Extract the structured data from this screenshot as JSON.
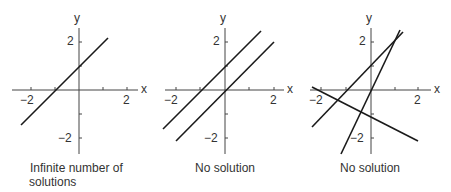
{
  "panels": [
    {
      "caption_line1": "Infinite number of",
      "caption_line2": "solutions",
      "axis_labels": {
        "x": "x",
        "y": "y"
      },
      "ticks": {
        "x_neg": "−2",
        "x_pos": "2",
        "y_pos": "2",
        "y_neg": "−2"
      },
      "lines": [
        "y = x + 1 (coincident)"
      ]
    },
    {
      "caption_line1": "No solution",
      "axis_labels": {
        "x": "x",
        "y": "y"
      },
      "ticks": {
        "x_neg": "−2",
        "x_pos": "2",
        "y_pos": "2",
        "y_neg": "−2"
      },
      "lines": [
        "y = x + 1",
        "y = x"
      ]
    },
    {
      "caption_line1": "No solution",
      "axis_labels": {
        "x": "x",
        "y": "y"
      },
      "ticks": {
        "x_neg": "−2",
        "x_pos": "2",
        "y_pos": "2",
        "y_neg": "−2"
      },
      "lines": [
        "y = x + 1",
        "y = 2x",
        "y = -0.5x - 1"
      ]
    }
  ],
  "colors": {
    "line": "#1a1a1a",
    "axis": "#444444",
    "text": "#333333"
  }
}
